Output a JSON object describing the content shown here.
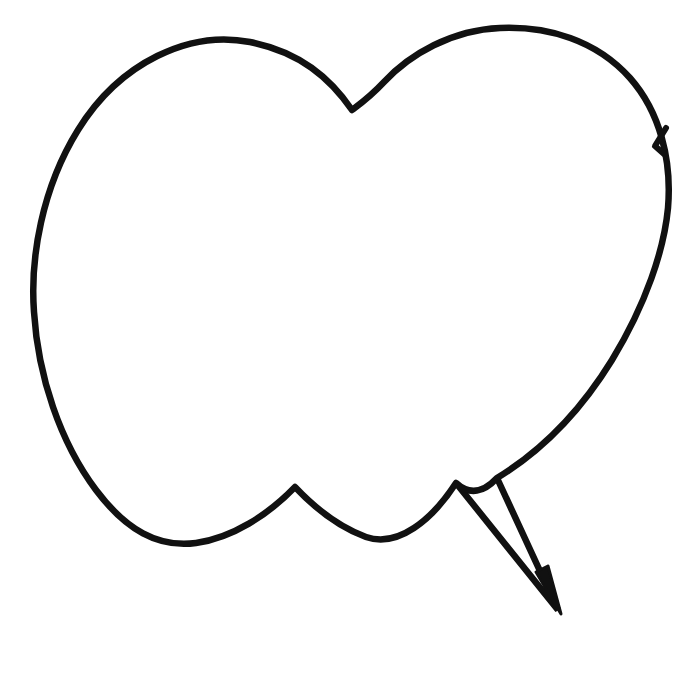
{
  "canvas": {
    "width": 698,
    "height": 687,
    "background_color": "#ffffff"
  },
  "artwork": {
    "title": "Speech Bubble Outline",
    "style": "hand-drawn line art",
    "stroke_color": "#111111",
    "fill_color": "#ffffff",
    "stroke_width": 6.5,
    "description": "Hand-drawn empty speech balloon with two rounded upper lobes separated by a central notch, a scalloped lower edge with two cusps, and a long narrow pointed tail extending to the lower right."
  },
  "shape": {
    "body_label": "speech-balloon-body",
    "tail_label": "speech-balloon-tail",
    "body_path": "M 352 110 C 330 78 300 52 250 42 C 190 30 120 62 78 130 C 42 188 30 258 34 312 C 38 376 60 442 96 490 C 126 530 158 548 196 543 C 232 538 268 515 295 487 C 312 505 336 526 366 537 C 398 548 432 520 456 483 C 470 496 484 492 497 478 C 540 452 580 412 612 360 C 646 304 664 250 668 208 C 672 160 660 112 630 78 C 596 40 548 26 500 28 C 452 30 410 54 384 82 C 370 97 360 104 352 110 Z",
    "tail_path": "M 456 483 L 558 610 L 497 478",
    "tail_tip_path": "M 536 572 L 561 614 L 548 566 Z",
    "kink_path": "M 666 128 L 655 146 L 664 154",
    "anchors": {
      "top_notch": [
        352,
        110
      ],
      "left_lobe_peak": [
        195,
        42
      ],
      "right_lobe_peak": [
        500,
        28
      ],
      "leftmost": [
        32,
        290
      ],
      "rightmost": [
        668,
        208
      ],
      "bottom_cusp_left": [
        295,
        487
      ],
      "bottom_cusp_right": [
        456,
        483
      ],
      "bottom_dip_left": [
        196,
        543
      ],
      "bottom_dip_middle": [
        380,
        538
      ],
      "tail_tip": [
        558,
        610
      ],
      "tail_upper_anchor": [
        497,
        478
      ]
    }
  },
  "meta": {
    "element_count_label": "1 shape",
    "is_empty_balloon": true
  }
}
